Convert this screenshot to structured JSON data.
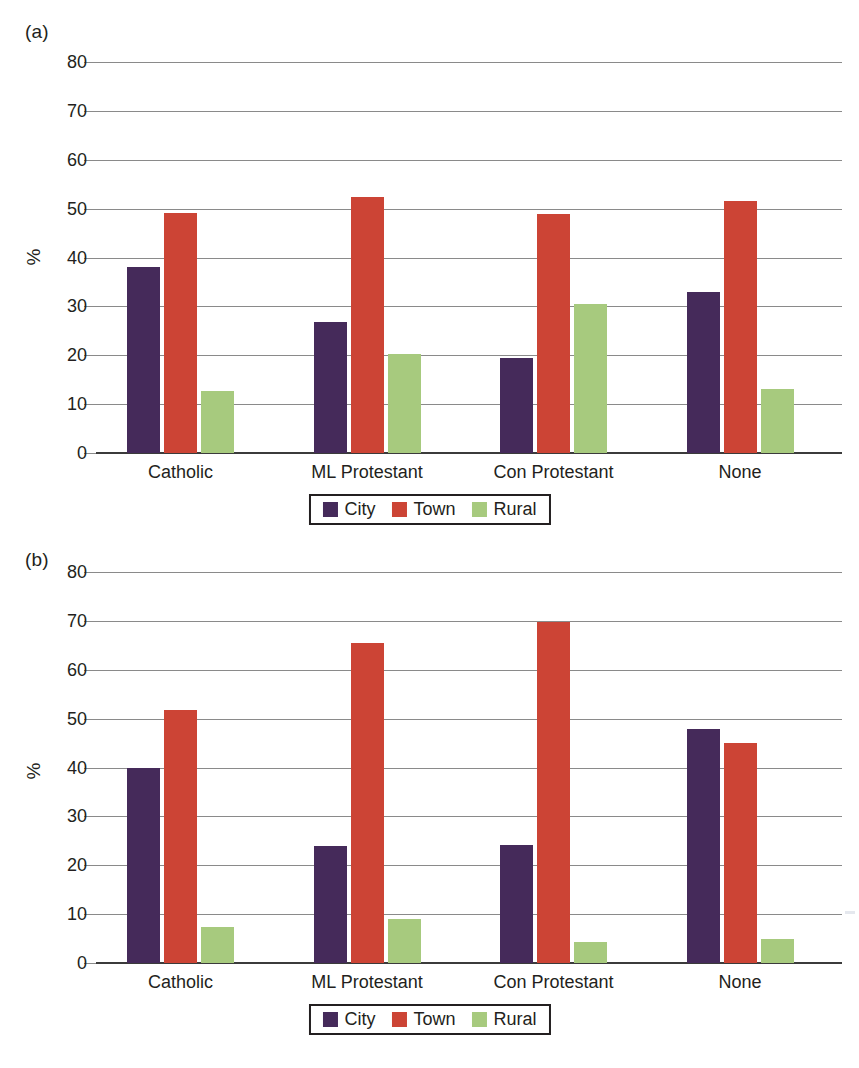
{
  "figure": {
    "panel_a_label": "(a)",
    "panel_b_label": "(b)",
    "y_axis_title": "%"
  },
  "legend": {
    "items": [
      {
        "label": "City",
        "color": "#452a5a"
      },
      {
        "label": "Town",
        "color": "#cc4435"
      },
      {
        "label": "Rural",
        "color": "#a7ca7e"
      }
    ]
  },
  "chart_data": [
    {
      "type": "bar",
      "panel": "(a)",
      "title": "",
      "xlabel": "",
      "ylabel": "%",
      "categories": [
        "Catholic",
        "ML Protestant",
        "Con Protestant",
        "None"
      ],
      "series": [
        {
          "name": "City",
          "color": "#452a5a",
          "values": [
            38.0,
            26.8,
            19.5,
            33.0
          ]
        },
        {
          "name": "Town",
          "color": "#cc4435",
          "values": [
            49.2,
            52.3,
            48.9,
            51.5
          ]
        },
        {
          "name": "Rural",
          "color": "#a7ca7e",
          "values": [
            12.7,
            20.2,
            30.5,
            13.2
          ]
        }
      ],
      "ylim": [
        0,
        80
      ],
      "yticks": [
        0,
        10,
        20,
        30,
        40,
        50,
        60,
        70,
        80
      ],
      "ytick_labels": [
        "0",
        "10",
        "20",
        "30",
        "40",
        "50",
        "60",
        "70",
        "80"
      ],
      "grid": true,
      "legend_position": "bottom"
    },
    {
      "type": "bar",
      "panel": "(b)",
      "title": "",
      "xlabel": "",
      "ylabel": "%",
      "categories": [
        "Catholic",
        "ML Protestant",
        "Con Protestant",
        "None"
      ],
      "series": [
        {
          "name": "City",
          "color": "#452a5a",
          "values": [
            40.0,
            24.0,
            24.2,
            47.8
          ]
        },
        {
          "name": "Town",
          "color": "#cc4435",
          "values": [
            51.8,
            65.5,
            69.8,
            45.0
          ]
        },
        {
          "name": "Rural",
          "color": "#a7ca7e",
          "values": [
            7.4,
            9.0,
            4.3,
            4.9
          ]
        }
      ],
      "ylim": [
        0,
        80
      ],
      "yticks": [
        0,
        10,
        20,
        30,
        40,
        50,
        60,
        70,
        80
      ],
      "ytick_labels": [
        "0",
        "10",
        "20",
        "30",
        "40",
        "50",
        "60",
        "70",
        "80"
      ],
      "grid": true,
      "legend_position": "bottom"
    }
  ]
}
